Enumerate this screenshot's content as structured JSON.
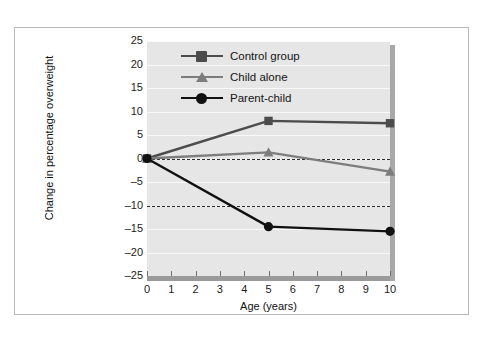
{
  "chart_data": {
    "type": "line",
    "title": "",
    "xlabel": "Age (years)",
    "ylabel": "Change in percentage overweight",
    "x": [
      0,
      5,
      10
    ],
    "xlim": [
      0,
      10
    ],
    "ylim": [
      -25,
      25
    ],
    "x_ticks": [
      0,
      1,
      2,
      3,
      4,
      5,
      6,
      7,
      8,
      9,
      10
    ],
    "x_tick_labels": [
      "0",
      "1",
      "2",
      "3",
      "4",
      "5",
      "6",
      "7",
      "8",
      "9",
      "10"
    ],
    "y_ticks": [
      25,
      20,
      15,
      10,
      5,
      0,
      -5,
      -10,
      -15,
      -20,
      -25
    ],
    "y_tick_labels": [
      "25",
      "20",
      "15",
      "10",
      "5",
      "0",
      "–5",
      "–10",
      "–15",
      "–20",
      "–25"
    ],
    "grid": true,
    "legend_position": "upper-left-inside",
    "reference_lines": [
      {
        "value": 0,
        "style": "dashed"
      },
      {
        "value": -10,
        "style": "dashed"
      }
    ],
    "series": [
      {
        "name": "Control group",
        "marker": "square",
        "color": "#4c4c4c",
        "values": [
          0,
          8,
          7.5
        ]
      },
      {
        "name": "Child alone",
        "marker": "triangle",
        "color": "#7d7d7d",
        "values": [
          0,
          1.3,
          -2.8
        ]
      },
      {
        "name": "Parent-child",
        "marker": "circle",
        "color": "#111111",
        "values": [
          0,
          -14.5,
          -15.5
        ]
      }
    ]
  },
  "legend": {
    "items": [
      {
        "label": "Control group"
      },
      {
        "label": "Child alone"
      },
      {
        "label": "Parent-child"
      }
    ]
  },
  "axes": {
    "x_title": "Age (years)",
    "y_title": "Change in percentage overweight"
  },
  "colors": {
    "plot_background": "#e6e6e6",
    "gridline": "#fafafa",
    "axis_bar": "#9a9a9a",
    "shadow": "#a8a8a8",
    "frame_border": "#b9b9bd",
    "reference_line": "#2b2b2b"
  }
}
